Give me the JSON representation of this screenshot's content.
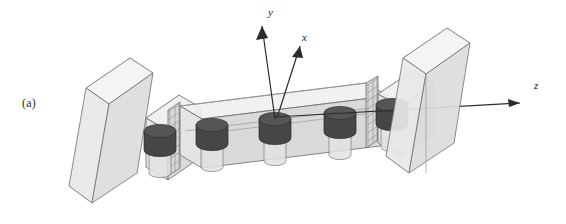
{
  "figure": {
    "panel_label": "(a)",
    "caption_visible": false,
    "background_color": "#ffffff"
  },
  "axes": {
    "origin_name": "central-resonator-top",
    "items": [
      {
        "name": "y-axis",
        "label": "y",
        "direction": "up-left",
        "label_x": 268,
        "label_y": 16
      },
      {
        "name": "x-axis",
        "label": "x",
        "direction": "up-right",
        "label_x": 302,
        "label_y": 41
      },
      {
        "name": "z-axis",
        "label": "z",
        "direction": "right",
        "label_x": 537,
        "label_y": 89
      }
    ],
    "line_color": "#2b2b2b"
  },
  "structure": {
    "support_blocks": [
      {
        "name": "left-support-block",
        "side": "left"
      },
      {
        "name": "right-support-block",
        "side": "right"
      }
    ],
    "beam_segments": [
      {
        "name": "beam-segment-1"
      },
      {
        "name": "beam-segment-2"
      },
      {
        "name": "beam-segment-3"
      }
    ],
    "joints": [
      {
        "name": "beam-joint-left"
      },
      {
        "name": "beam-joint-right"
      }
    ],
    "resonators": [
      {
        "name": "resonator-1",
        "index": 1
      },
      {
        "name": "resonator-2",
        "index": 2
      },
      {
        "name": "resonator-3",
        "index": 3
      },
      {
        "name": "resonator-4",
        "index": 4
      },
      {
        "name": "resonator-5",
        "index": 5
      }
    ],
    "resonator_count": 5
  },
  "colors": {
    "mass_dark": "#464646",
    "mass_top": "#555555",
    "glass_fill": "#e8e8e8",
    "edge_stroke": "#6e6e6e",
    "axis": "#2b2b2b"
  }
}
